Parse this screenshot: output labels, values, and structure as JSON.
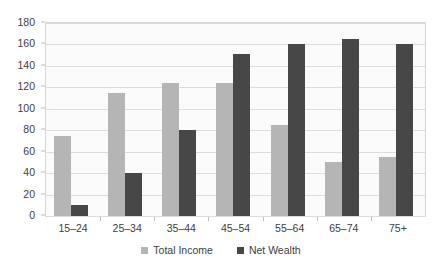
{
  "chart_data": {
    "type": "bar",
    "title": "",
    "subtitle": "",
    "xlabel": "",
    "ylabel": "",
    "categories": [
      "15–24",
      "25–34",
      "35–44",
      "45–54",
      "55–64",
      "65–74",
      "75+"
    ],
    "series": [
      {
        "name": "Total Income",
        "color": "#b5b5b5",
        "values": [
          75,
          115,
          124,
          124,
          85,
          50,
          55
        ]
      },
      {
        "name": "Net Wealth",
        "color": "#474747",
        "values": [
          10,
          40,
          80,
          151,
          160,
          165,
          160
        ]
      }
    ],
    "ylim": [
      0,
      180
    ],
    "ytick_values": [
      0,
      20,
      40,
      60,
      80,
      100,
      120,
      140,
      160,
      180
    ],
    "ytick_labels": [
      "0",
      "20",
      "40",
      "60",
      "80",
      "100",
      "120",
      "140",
      "160",
      "180"
    ],
    "grid": true,
    "grid_axis": "y",
    "legend_position": "bottom",
    "plot_background": "#fbfbfb",
    "grid_color": "#dcdcdc",
    "axis_color": "#d4d4d4"
  }
}
